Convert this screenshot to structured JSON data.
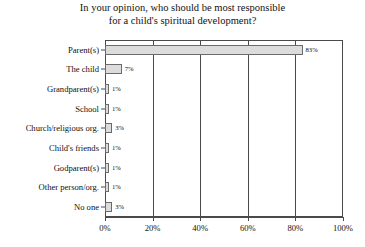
{
  "chart_data": {
    "type": "bar",
    "orientation": "horizontal",
    "title": "In your opinion, who should be most responsible for a child's spiritual development?",
    "title_lines": [
      "In your opinion, who should be most responsible",
      "for a child's spiritual development?"
    ],
    "categories": [
      "Parent(s)",
      "The child",
      "Grandparent(s)",
      "School",
      "Church/religious org.",
      "Child's friends",
      "Godparent(s)",
      "Other person/org.",
      "No one"
    ],
    "values": [
      83,
      7,
      1,
      1,
      3,
      1,
      1,
      1,
      3
    ],
    "value_labels": [
      "83%",
      "7%",
      "1%",
      "1%",
      "3%",
      "1%",
      "1%",
      "1%",
      "3%"
    ],
    "xlabel": "",
    "ylabel": "",
    "xlim": [
      0,
      100
    ],
    "xticks": [
      0,
      20,
      40,
      60,
      80,
      100
    ],
    "xtick_labels": [
      "0%",
      "20%",
      "40%",
      "60%",
      "80%",
      "100%"
    ],
    "grid": true,
    "grid_axis": "x",
    "legend": false,
    "bar_fill_color": "#dcdcdc",
    "bar_border_color": "#6b6b6b",
    "axis_color": "#4a4a4a",
    "background_color": "#ffffff",
    "text_color": "#111111"
  }
}
